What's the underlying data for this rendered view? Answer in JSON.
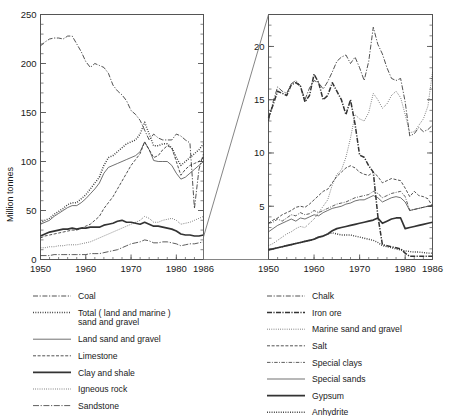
{
  "figure": {
    "ylabel": "Million tonnes",
    "background": "#ffffff",
    "line_color": "#333333"
  },
  "chart_data": {
    "type": "line",
    "title": "",
    "xlabel": "",
    "ylabel": "Million tonnes",
    "grid": false,
    "legend_position": "below",
    "panels": [
      {
        "name": "left-panel",
        "xlim": [
          1950,
          1986
        ],
        "ylim": [
          0,
          250
        ],
        "ymajor": [
          0,
          50,
          100,
          150,
          200,
          250
        ],
        "yminor_step": 10,
        "xticks": [
          1950,
          1960,
          1970,
          1980,
          1986
        ],
        "xtick_labels": [
          "1950",
          "1960",
          "1970",
          "1980",
          "1986"
        ],
        "ytick_labels": [
          "0",
          "50",
          "100",
          "150",
          "200",
          "250"
        ],
        "x": [
          1950,
          1951,
          1952,
          1953,
          1954,
          1955,
          1956,
          1957,
          1958,
          1959,
          1960,
          1961,
          1962,
          1963,
          1964,
          1965,
          1966,
          1967,
          1968,
          1969,
          1970,
          1971,
          1972,
          1973,
          1974,
          1975,
          1976,
          1977,
          1978,
          1979,
          1980,
          1981,
          1982,
          1983,
          1984,
          1985,
          1986
        ],
        "series": [
          {
            "name": "Coal",
            "style": "dashdot",
            "values": [
              218,
              222,
              225,
              226,
              226,
              225,
              228,
              228,
              220,
              212,
              202,
              196,
              200,
              198,
              196,
              190,
              178,
              172,
              168,
              162,
              152,
              148,
              142,
              132,
              122,
              128,
              124,
              122,
              122,
              122,
              128,
              126,
              122,
              119,
              52,
              92,
              108
            ]
          },
          {
            "name": "Total ( land and marine ) sand and gravel",
            "style": "dotted",
            "values": [
              37,
              40,
              42,
              46,
              49,
              52,
              56,
              58,
              58,
              62,
              66,
              72,
              78,
              84,
              96,
              104,
              106,
              110,
              114,
              118,
              120,
              122,
              128,
              140,
              128,
              116,
              116,
              118,
              118,
              114,
              104,
              96,
              100,
              104,
              108,
              112,
              118
            ]
          },
          {
            "name": "Land sand and gravel",
            "style": "thin-solid",
            "values": [
              36,
              38,
              40,
              44,
              47,
              50,
              53,
              55,
              55,
              58,
              62,
              67,
              72,
              78,
              88,
              94,
              96,
              98,
              100,
              102,
              104,
              106,
              110,
              120,
              112,
              101,
              100,
              100,
              100,
              96,
              88,
              82,
              84,
              88,
              92,
              96,
              100
            ]
          },
          {
            "name": "Limestone",
            "style": "dashed",
            "values": [
              22,
              24,
              25,
              26,
              27,
              28,
              29,
              30,
              30,
              32,
              34,
              36,
              40,
              44,
              52,
              58,
              64,
              72,
              80,
              88,
              96,
              102,
              108,
              120,
              112,
              104,
              106,
              112,
              116,
              114,
              100,
              86,
              92,
              96,
              98,
              100,
              104
            ]
          },
          {
            "name": "Clay and shale",
            "style": "thick-solid",
            "values": [
              24,
              26,
              28,
              29,
              30,
              31,
              31,
              32,
              31,
              32,
              32,
              33,
              33,
              33,
              35,
              36,
              37,
              39,
              40,
              38,
              38,
              37,
              36,
              38,
              36,
              34,
              34,
              33,
              32,
              31,
              29,
              26,
              25,
              25,
              24,
              24,
              25
            ]
          },
          {
            "name": "Igneous rock",
            "style": "fine-dotted",
            "values": [
              12,
              12,
              13,
              13,
              14,
              14,
              15,
              15,
              15,
              16,
              17,
              18,
              20,
              22,
              24,
              26,
              28,
              30,
              32,
              34,
              36,
              38,
              40,
              44,
              42,
              38,
              38,
              40,
              41,
              42,
              40,
              36,
              37,
              38,
              40,
              42,
              44
            ]
          },
          {
            "name": "Sandstone",
            "style": "dashdot-thin",
            "values": [
              4,
              4,
              4,
              5,
              5,
              5,
              5,
              5,
              5,
              5,
              5,
              6,
              6,
              6,
              7,
              8,
              9,
              10,
              12,
              14,
              16,
              17,
              18,
              20,
              19,
              17,
              17,
              18,
              18,
              17,
              16,
              14,
              15,
              16,
              16,
              17,
              18
            ]
          }
        ]
      },
      {
        "name": "right-panel",
        "xlim": [
          1950,
          1986
        ],
        "ylim": [
          0,
          23
        ],
        "ymajor": [
          5,
          10,
          15,
          20
        ],
        "yminor_step": 1,
        "xticks": [
          1950,
          1960,
          1970,
          1980,
          1986
        ],
        "xtick_labels": [
          "1950",
          "1960",
          "1970",
          "1980",
          "1986"
        ],
        "ytick_labels": [
          "5",
          "10",
          "15",
          "20"
        ],
        "x": [
          1950,
          1951,
          1952,
          1953,
          1954,
          1955,
          1956,
          1957,
          1958,
          1959,
          1960,
          1961,
          1962,
          1963,
          1964,
          1965,
          1966,
          1967,
          1968,
          1969,
          1970,
          1971,
          1972,
          1973,
          1974,
          1975,
          1976,
          1977,
          1978,
          1979,
          1980,
          1981,
          1982,
          1983,
          1984,
          1985,
          1986
        ],
        "series": [
          {
            "name": "Chalk",
            "style": "dashdot",
            "values": [
              13.0,
              14.8,
              16.2,
              15.8,
              15.6,
              16.5,
              16.8,
              16.3,
              15.0,
              16.1,
              16.8,
              16.6,
              16.0,
              16.7,
              17.6,
              18.6,
              19.0,
              19.2,
              18.4,
              19.0,
              18.0,
              16.8,
              18.6,
              21.8,
              20.2,
              19.3,
              18.0,
              17.0,
              16.8,
              17.0,
              14.8,
              11.6,
              11.8,
              12.4,
              12.0,
              12.2,
              12.6
            ]
          },
          {
            "name": "Iron ore",
            "style": "dashdot-thick",
            "values": [
              13.3,
              14.5,
              15.8,
              15.6,
              15.4,
              16.4,
              16.6,
              16.3,
              14.8,
              15.4,
              17.4,
              16.6,
              15.0,
              15.4,
              16.6,
              15.8,
              15.0,
              13.6,
              15.0,
              12.7,
              9.8,
              9.6,
              8.8,
              8.2,
              4.1,
              1.4,
              1.3,
              1.2,
              1.1,
              1.0,
              0.6,
              0.3,
              0.3,
              0.3,
              0.3,
              0.3,
              0.3
            ]
          },
          {
            "name": "Marine sand and gravel",
            "style": "fine-dotted",
            "values": [
              1.3,
              1.5,
              1.8,
              2.1,
              2.4,
              2.6,
              2.9,
              3.1,
              3.0,
              3.4,
              3.8,
              4.4,
              5.0,
              5.6,
              7.0,
              8.0,
              8.4,
              9.6,
              11.4,
              13.6,
              13.2,
              13.0,
              13.8,
              15.6,
              15.0,
              14.2,
              14.6,
              15.4,
              15.8,
              15.2,
              13.6,
              11.9,
              12.0,
              12.6,
              13.2,
              14.4,
              17.6
            ]
          },
          {
            "name": "Salt",
            "style": "dashed",
            "values": [
              3.4,
              3.7,
              3.9,
              4.2,
              4.4,
              4.6,
              4.9,
              5.0,
              4.9,
              5.2,
              5.6,
              6.0,
              6.4,
              6.6,
              7.2,
              7.8,
              8.2,
              8.6,
              8.8,
              8.6,
              8.2,
              8.0,
              7.9,
              8.2,
              7.8,
              7.2,
              7.4,
              7.6,
              7.5,
              7.4,
              6.7,
              5.9,
              6.4,
              6.0,
              5.9,
              5.7,
              5.0
            ]
          },
          {
            "name": "Special clays",
            "style": "dashdot-fine",
            "values": [
              3.4,
              3.5,
              3.8,
              3.6,
              3.9,
              4.2,
              4.1,
              4.4,
              4.2,
              4.3,
              4.6,
              4.4,
              4.6,
              4.8,
              5.0,
              5.2,
              5.3,
              5.4,
              5.6,
              5.8,
              5.9,
              6.0,
              6.1,
              6.4,
              6.2,
              5.8,
              6.0,
              6.2,
              6.3,
              6.4,
              5.9,
              4.6,
              4.7,
              4.8,
              4.9,
              5.0,
              5.0
            ]
          },
          {
            "name": "Special sands",
            "style": "thin-solid",
            "values": [
              2.6,
              2.9,
              3.2,
              3.4,
              3.6,
              3.8,
              3.6,
              3.9,
              3.8,
              4.0,
              4.2,
              4.1,
              4.4,
              4.6,
              4.8,
              4.9,
              5.0,
              5.2,
              5.3,
              5.5,
              5.6,
              5.6,
              5.8,
              6.0,
              5.8,
              5.4,
              5.6,
              5.8,
              5.9,
              5.8,
              5.4,
              4.6,
              4.7,
              4.8,
              4.9,
              5.0,
              5.1
            ]
          },
          {
            "name": "Gypsum",
            "style": "thick-solid",
            "values": [
              0.9,
              1.0,
              1.1,
              1.2,
              1.3,
              1.4,
              1.5,
              1.6,
              1.7,
              1.8,
              1.9,
              2.1,
              2.2,
              2.4,
              2.7,
              2.9,
              3.0,
              3.1,
              3.2,
              3.3,
              3.4,
              3.5,
              3.6,
              3.7,
              3.9,
              3.4,
              3.6,
              3.8,
              3.9,
              3.9,
              2.9,
              3.0,
              3.1,
              3.2,
              3.3,
              3.4,
              3.5
            ]
          },
          {
            "name": "Anhydrite",
            "style": "fine-dotted-thick",
            "values": [
              0.9,
              1.0,
              1.1,
              1.2,
              1.3,
              1.4,
              1.5,
              1.6,
              1.7,
              1.8,
              1.9,
              2.1,
              2.2,
              2.4,
              2.5,
              2.4,
              2.3,
              2.3,
              2.3,
              2.2,
              2.1,
              2.0,
              1.9,
              1.8,
              1.6,
              1.3,
              1.2,
              1.1,
              1.0,
              0.9,
              0.8,
              0.75,
              0.7,
              0.7,
              0.65,
              0.6,
              0.6
            ]
          }
        ]
      }
    ]
  },
  "legend": {
    "left_column": [
      {
        "label": "Coal",
        "style": "dashdot"
      },
      {
        "label": "Total ( land and marine )",
        "label2": "sand and gravel",
        "style": "dotted"
      },
      {
        "label": "Land sand and gravel",
        "style": "thin-solid"
      },
      {
        "label": "Limestone",
        "style": "dashed"
      },
      {
        "label": "Clay and shale",
        "style": "thick-solid"
      },
      {
        "label": "Igneous rock",
        "style": "fine-dotted"
      },
      {
        "label": "Sandstone",
        "style": "dashdot-thin"
      }
    ],
    "right_column": [
      {
        "label": "Chalk",
        "style": "dashdot"
      },
      {
        "label": "Iron ore",
        "style": "dashdot-thick"
      },
      {
        "label": "Marine sand and gravel",
        "style": "fine-dotted"
      },
      {
        "label": "Salt",
        "style": "dashed"
      },
      {
        "label": "Special clays",
        "style": "dashdot-fine"
      },
      {
        "label": "Special sands",
        "style": "thin-solid"
      },
      {
        "label": "Gypsum",
        "style": "thick-solid"
      },
      {
        "label": "Anhydrite",
        "style": "fine-dotted-thick"
      }
    ]
  }
}
